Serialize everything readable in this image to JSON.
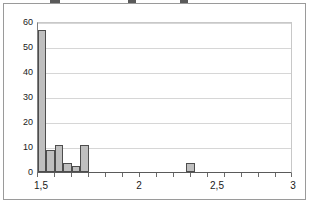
{
  "chart_data": {
    "type": "bar",
    "title": "",
    "subtitle": "",
    "xlabel": "",
    "ylabel": "",
    "grid": true,
    "legend": null,
    "xlim": [
      1.5,
      3.0
    ],
    "ylim": [
      0,
      60
    ],
    "x_tick_labels": [
      "1,5",
      "2",
      "2,5",
      "3"
    ],
    "x_tick_values": [
      1.5,
      2.0,
      2.5,
      3.0
    ],
    "x_minor_tick_count": 15,
    "y_tick_labels": [
      "0",
      "10",
      "20",
      "30",
      "40",
      "50",
      "60"
    ],
    "y_tick_values": [
      0,
      10,
      20,
      30,
      40,
      50,
      60
    ],
    "bin_width": 0.05,
    "categories": [
      "1,50",
      "1,55",
      "1,60",
      "1,65",
      "1,70",
      "1,75",
      "1,80",
      "1,85",
      "1,90",
      "1,95",
      "2,00",
      "2,05",
      "2,10",
      "2,15",
      "2,20",
      "2,25",
      "2,30",
      "2,35",
      "2,40",
      "2,45",
      "2,50",
      "2,55",
      "2,60",
      "2,65",
      "2,70",
      "2,75",
      "2,80",
      "2,85",
      "2,90",
      "2,95"
    ],
    "values": [
      57,
      9,
      11,
      3.5,
      2.5,
      11,
      0,
      0,
      0,
      0,
      0,
      0,
      0,
      0,
      0,
      0,
      0,
      0,
      3.5,
      0,
      0,
      0,
      0,
      0,
      0,
      0,
      0,
      0,
      0,
      0
    ],
    "bars": [
      {
        "label": "bar-1",
        "x_start": 1.5,
        "x_end": 1.55,
        "value": 57
      },
      {
        "label": "bar-2",
        "x_start": 1.55,
        "x_end": 1.6,
        "value": 9
      },
      {
        "label": "bar-3",
        "x_start": 1.6,
        "x_end": 1.65,
        "value": 11
      },
      {
        "label": "bar-4",
        "x_start": 1.65,
        "x_end": 1.7,
        "value": 3.5
      },
      {
        "label": "bar-5",
        "x_start": 1.7,
        "x_end": 1.75,
        "value": 2.5
      },
      {
        "label": "bar-6",
        "x_start": 1.75,
        "x_end": 1.8,
        "value": 11
      },
      {
        "label": "bar-7",
        "x_start": 2.38,
        "x_end": 2.43,
        "value": 3.5
      }
    ],
    "colors": {
      "bar_fill": "#bfbfbf",
      "bar_border": "#4d4d4d",
      "gridline": "#d6d6d6",
      "axis": "#5a5a5a",
      "frame": "#9a9a9a",
      "text": "#1a1a1a",
      "background": "#ffffff"
    }
  }
}
